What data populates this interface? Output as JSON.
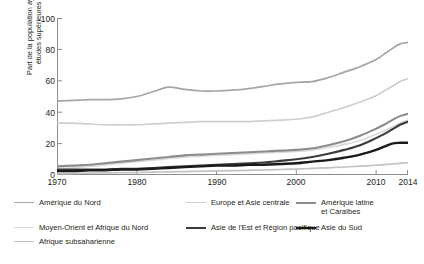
{
  "axes": {
    "ylabel_line1": "Part de la population ayant achevé des",
    "ylabel_line2": "études supérieures (en %)",
    "ytick_labels": [
      "100",
      "80",
      "60",
      "40",
      "20",
      "0"
    ],
    "xtick_labels": [
      "1970",
      "1980",
      "1990",
      "2000",
      "2010",
      "2014"
    ]
  },
  "legend": {
    "items": [
      {
        "label": "Amérique du Nord",
        "color": "#a6a6a6",
        "width": 1.7
      },
      {
        "label": "Europe et Asie centrale",
        "color": "#cfcfcf",
        "width": 1.7
      },
      {
        "label": "Amérique latine\net Caraïbes",
        "color": "#8c8c8c",
        "width": 2.1
      },
      {
        "label": "Moyen-Orient et Afrique du Nord",
        "color": "#d9d9d9",
        "width": 1.7
      },
      {
        "label": "Asie de l'Est et Région pacifique",
        "color": "#3b3b3b",
        "width": 2.1
      },
      {
        "label": "Asie du Sud",
        "color": "#1a1a1a",
        "width": 2.4
      },
      {
        "label": "Afrique subsaharienne",
        "color": "#c2c2c2",
        "width": 1.7
      }
    ]
  },
  "chart_data": {
    "type": "line",
    "title": "",
    "xlabel": "",
    "ylabel": "Part de la population ayant achevé des études supérieures (en %)",
    "xlim": [
      1970,
      2014
    ],
    "ylim": [
      0,
      100
    ],
    "grid": false,
    "legend_position": "bottom",
    "x": [
      1970,
      1972,
      1974,
      1976,
      1978,
      1980,
      1982,
      1984,
      1986,
      1988,
      1990,
      1992,
      1994,
      1996,
      1998,
      2000,
      2002,
      2004,
      2006,
      2008,
      2010,
      2011,
      2012,
      2013,
      2014
    ],
    "series": [
      {
        "name": "Amérique du Nord",
        "color": "#a6a6a6",
        "values": [
          47,
          47.5,
          48,
          48,
          48.5,
          50,
          53,
          56,
          54.5,
          53.5,
          53.5,
          54,
          55,
          56.5,
          58,
          59,
          59.5,
          62,
          65.5,
          69,
          73.5,
          77,
          80.5,
          83.5,
          84.5
        ]
      },
      {
        "name": "Europe et Asie centrale",
        "color": "#cfcfcf",
        "values": [
          33,
          33,
          32.5,
          32,
          32,
          32,
          32.5,
          33,
          33.5,
          34,
          34,
          34,
          34,
          34.5,
          35,
          35.5,
          37,
          40,
          43,
          46.5,
          50.5,
          53.5,
          56.5,
          59.5,
          61.5
        ]
      },
      {
        "name": "Amérique latine et Caraïbes",
        "color": "#8c8c8c",
        "values": [
          5.5,
          6,
          6.5,
          7.5,
          8.5,
          9.5,
          10.5,
          11.5,
          12.5,
          13,
          13.5,
          14,
          14.5,
          15,
          15.5,
          16,
          17,
          19,
          21.5,
          25,
          29.5,
          32,
          35,
          37.5,
          39
        ]
      },
      {
        "name": "Moyen-Orient et Afrique du Nord",
        "color": "#d9d9d9",
        "values": [
          4,
          4.5,
          5.5,
          6.5,
          7.5,
          8.5,
          9.5,
          10.5,
          11.5,
          12,
          12.5,
          13,
          13.5,
          14,
          14.5,
          15,
          16,
          17.5,
          19.5,
          22,
          26,
          28,
          30.5,
          33,
          35
        ]
      },
      {
        "name": "Asie de l'Est et Région pacifique",
        "color": "#3b3b3b",
        "values": [
          3.5,
          3.5,
          3.5,
          3.5,
          4,
          4,
          4.5,
          5,
          5.5,
          6,
          6.5,
          7,
          7.5,
          8,
          9,
          10,
          11.5,
          13.5,
          16,
          19,
          23.5,
          26,
          29,
          32,
          34
        ]
      },
      {
        "name": "Asie du Sud",
        "color": "#1a1a1a",
        "values": [
          2.5,
          2.5,
          3,
          3,
          3.5,
          3.5,
          4,
          4.5,
          5,
          5.5,
          6,
          6,
          6.5,
          6.5,
          7,
          7.5,
          8.5,
          9.5,
          11,
          13,
          16,
          18,
          20,
          20.5,
          20.5
        ]
      },
      {
        "name": "Afrique subsaharienne",
        "color": "#c2c2c2",
        "values": [
          1,
          1,
          1.2,
          1.3,
          1.5,
          1.6,
          1.8,
          2,
          2.2,
          2.4,
          2.6,
          2.8,
          3,
          3.2,
          3.5,
          3.8,
          4.2,
          4.6,
          5.1,
          5.6,
          6.2,
          6.6,
          7,
          7.4,
          7.8
        ]
      }
    ]
  }
}
